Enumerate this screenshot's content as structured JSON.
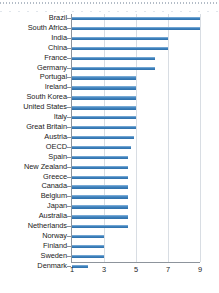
{
  "chart_data": {
    "type": "bar",
    "orientation": "horizontal",
    "title": "",
    "subtitle": "",
    "xlabel": "",
    "ylabel": "",
    "xlim": [
      1,
      9
    ],
    "xticks": [
      1,
      3,
      5,
      7,
      9
    ],
    "xtick_labels": [
      "1",
      "3",
      "5",
      "7",
      "9"
    ],
    "grid": true,
    "legend": null,
    "bar_color": "#3f83bf",
    "axis_color": "#8d949c",
    "gridline_color": "#d8dde3",
    "categories": [
      "Brazil",
      "South Africa",
      "India",
      "China",
      "France",
      "Germany",
      "Portugal",
      "Ireland",
      "South Korea",
      "United States",
      "Italy",
      "Great Britain",
      "Austria",
      "OECD",
      "Spain",
      "New Zealand",
      "Greece",
      "Canada",
      "Belgium",
      "Japan",
      "Australia",
      "Netherlands",
      "Norway",
      "Finland",
      "Sweden",
      "Denmark"
    ],
    "values": [
      9.0,
      9.0,
      7.0,
      7.0,
      6.2,
      6.2,
      5.0,
      5.0,
      5.0,
      5.0,
      5.0,
      5.0,
      4.9,
      4.7,
      4.5,
      4.5,
      4.5,
      4.5,
      4.5,
      4.5,
      4.5,
      4.5,
      3.0,
      3.0,
      3.0,
      2.0
    ]
  }
}
